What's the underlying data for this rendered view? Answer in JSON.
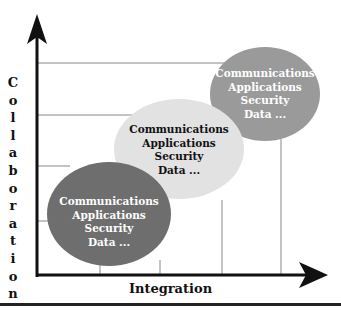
{
  "diagram": {
    "y_axis_label": "Collaboration",
    "x_axis_label": "Integration",
    "colors": {
      "axis": "#111111",
      "gridline": "#888888",
      "ellipse_low": "#6e6e6e",
      "ellipse_mid": "#e2e2e2",
      "ellipse_high": "#9a9a9a",
      "text_on_dark": "#ffffff",
      "text_on_light": "#111111"
    },
    "ellipses": [
      {
        "level": "low",
        "lines": [
          "Communications",
          "Applications",
          "Security",
          "Data ..."
        ]
      },
      {
        "level": "mid",
        "lines": [
          "Communications",
          "Applications",
          "Security",
          "Data ..."
        ]
      },
      {
        "level": "high",
        "lines": [
          "Communications",
          "Applications",
          "Security",
          "Data ..."
        ]
      }
    ]
  }
}
